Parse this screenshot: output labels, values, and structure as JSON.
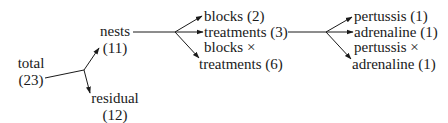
{
  "diagram": {
    "type": "degrees-of-freedom-partition-tree",
    "nodes": {
      "total": {
        "name": "total",
        "df": "(23)"
      },
      "nests": {
        "name": "nests",
        "df": "(11)"
      },
      "residual": {
        "name": "residual",
        "df": "(12)"
      },
      "blocks": {
        "label": "blocks (2)"
      },
      "treatments": {
        "label": "treatments (3)"
      },
      "blocks_x_treatments": {
        "line1": "blocks ×",
        "line2": "treatments (6)"
      },
      "pertussis": {
        "label": "pertussis (1)"
      },
      "adrenaline": {
        "label": "adrenaline (1)"
      },
      "pertussis_x_adrenaline": {
        "line1": "pertussis ×",
        "line2": "adrenaline (1)"
      }
    },
    "edges": [
      {
        "from": "total",
        "to": "nests"
      },
      {
        "from": "total",
        "to": "residual"
      },
      {
        "from": "nests",
        "to": "blocks"
      },
      {
        "from": "nests",
        "to": "treatments"
      },
      {
        "from": "nests",
        "to": "blocks_x_treatments"
      },
      {
        "from": "treatments",
        "to": "pertussis"
      },
      {
        "from": "treatments",
        "to": "adrenaline"
      },
      {
        "from": "treatments",
        "to": "pertussis_x_adrenaline"
      }
    ],
    "line_color": "#1a1a1a"
  }
}
